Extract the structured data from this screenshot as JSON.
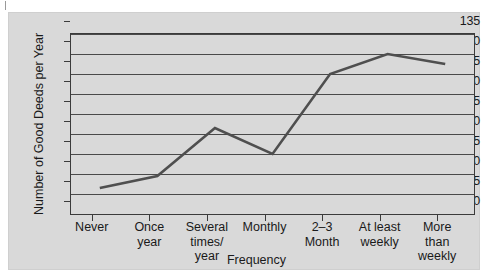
{
  "chart_data": {
    "type": "line",
    "title": "",
    "xlabel": "Frequency",
    "ylabel": "Number of Good Deeds per Year",
    "categories": [
      "Never",
      "Once\nyear",
      "Several\ntimes/\nyear",
      "Monthly",
      "2–3\nMonth",
      "At least\nweekly",
      "More\nthan\nweekly"
    ],
    "values": [
      96.5,
      99.5,
      111.5,
      105,
      125,
      130,
      127.5
    ],
    "ylim": [
      90,
      135
    ],
    "ytick_labels": [
      "135",
      "130",
      "125",
      "120",
      "115",
      "110",
      "105",
      "100",
      "95",
      "90"
    ],
    "yticks": [
      135,
      130,
      125,
      120,
      115,
      110,
      105,
      100,
      95,
      90
    ],
    "grid": true,
    "legend": "none",
    "series": [
      {
        "name": "Good deeds per year",
        "values": [
          96.5,
          99.5,
          111.5,
          105,
          125,
          130,
          127.5
        ],
        "color": "#4f4f4f"
      }
    ]
  },
  "colors": {
    "line": "#4f4f4f",
    "panel_background": "#d9d9d9",
    "axis": "#3b3b3b",
    "gridline": "#4a4a4a",
    "page_background": "#ffffff"
  }
}
